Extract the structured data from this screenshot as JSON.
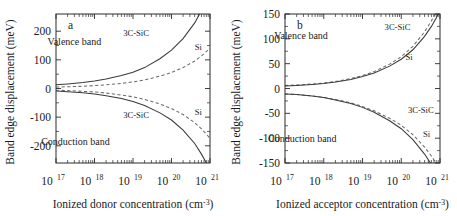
{
  "figure": {
    "panels": [
      "a",
      "b"
    ],
    "line_colors": {
      "solid": "#3a3a3a",
      "dashed": "#6b6b6b",
      "axis": "#2a2a2a"
    }
  },
  "chart_data": [
    {
      "type": "line",
      "panel": "a",
      "panel_letter": "a",
      "title": "",
      "xlabel": "Ionized donor concentration (cm",
      "xlabel_exponent": "-3",
      "xlabel_tail": ")",
      "ylabel": "Band edge displacement (meV)",
      "xscale": "log",
      "xlim": [
        1e+17,
        1e+21
      ],
      "ylim": [
        -260,
        260
      ],
      "xticks": [
        1e+17,
        1e+18,
        1e+19,
        1e+20,
        1e+21
      ],
      "xticklabels": [
        "10",
        "10",
        "10",
        "10",
        "10"
      ],
      "xtick_exponents": [
        "17",
        "18",
        "19",
        "20",
        "21"
      ],
      "yticks": [
        200,
        100,
        0,
        -100,
        -200
      ],
      "yticklabels": [
        "200",
        "100",
        "0",
        "-100",
        "-200"
      ],
      "grid": false,
      "legend": "inline-annotations",
      "annotations": [
        {
          "text": "Valence band",
          "x": 3e+17,
          "y": 152
        },
        {
          "text": "Conduction band",
          "x": 3.2e+17,
          "y": -196
        },
        {
          "text": "3C-SiC",
          "x": 1.2e+19,
          "y": 183
        },
        {
          "text": "Si",
          "x": 5e+20,
          "y": 133
        },
        {
          "text": "3C-SiC",
          "x": 1.2e+19,
          "y": -104
        },
        {
          "text": "Si",
          "x": 5e+20,
          "y": -92
        }
      ],
      "series": [
        {
          "name": "3C-SiC valence band",
          "material": "3C-SiC",
          "band": "valence",
          "style": "solid",
          "x": [
            1e+17,
            2e+17,
            5e+17,
            1e+18,
            2e+18,
            5e+18,
            1e+19,
            2e+19,
            5e+19,
            1e+20,
            2e+20,
            4e+20,
            6e+20,
            8e+20,
            1e+21
          ],
          "y": [
            13,
            16,
            21,
            26,
            33,
            45,
            57,
            73,
            104,
            134,
            174,
            229,
            272,
            308,
            338
          ]
        },
        {
          "name": "Si valence band",
          "material": "Si",
          "band": "valence",
          "style": "dashed",
          "x": [
            1e+17,
            2e+17,
            5e+17,
            1e+18,
            2e+18,
            5e+18,
            1e+19,
            2e+19,
            5e+19,
            1e+20,
            2e+20,
            4e+20,
            6e+20,
            8e+20,
            1e+21
          ],
          "y": [
            5,
            6,
            8,
            10,
            13,
            18,
            23,
            30,
            43,
            56,
            73,
            96,
            114,
            129,
            141
          ]
        },
        {
          "name": "3C-SiC conduction band",
          "material": "3C-SiC",
          "band": "conduction",
          "style": "solid",
          "x": [
            1e+17,
            2e+17,
            5e+17,
            1e+18,
            2e+18,
            5e+18,
            1e+19,
            2e+19,
            5e+19,
            1e+20,
            2e+20,
            4e+20,
            6e+20,
            8e+20,
            1e+21
          ],
          "y": [
            -9,
            -11,
            -15,
            -19,
            -25,
            -35,
            -45,
            -59,
            -85,
            -110,
            -145,
            -192,
            -229,
            -259,
            -285
          ]
        },
        {
          "name": "Si conduction band",
          "material": "Si",
          "band": "conduction",
          "style": "dashed",
          "x": [
            1e+17,
            2e+17,
            5e+17,
            1e+18,
            2e+18,
            5e+18,
            1e+19,
            2e+19,
            5e+19,
            1e+20,
            2e+20,
            4e+20,
            6e+20,
            8e+20,
            1e+21
          ],
          "y": [
            -6,
            -7,
            -10,
            -12,
            -16,
            -23,
            -29,
            -38,
            -54,
            -70,
            -91,
            -119,
            -141,
            -159,
            -174
          ]
        }
      ]
    },
    {
      "type": "line",
      "panel": "b",
      "panel_letter": "b",
      "title": "",
      "xlabel": "Ionized acceptor concentration (cm",
      "xlabel_exponent": "-3",
      "xlabel_tail": ")",
      "ylabel": "Band edge displacement (meV)",
      "xscale": "log",
      "xlim": [
        1e+17,
        1e+21
      ],
      "ylim": [
        -150,
        150
      ],
      "xticks": [
        1e+17,
        1e+18,
        1e+19,
        1e+20,
        1e+21
      ],
      "xticklabels": [
        "10",
        "10",
        "10",
        "10",
        "10"
      ],
      "xtick_exponents": [
        "17",
        "18",
        "19",
        "20",
        "21"
      ],
      "yticks": [
        150,
        100,
        50,
        0,
        -50,
        -100,
        -150
      ],
      "yticklabels": [
        "150",
        "100",
        "50",
        "0",
        "-50",
        "-100",
        "-150"
      ],
      "grid": false,
      "legend": "inline-annotations",
      "annotations": [
        {
          "text": "Valence band",
          "x": 2.6e+17,
          "y": 100
        },
        {
          "text": "Conduction band",
          "x": 2.8e+17,
          "y": -108
        },
        {
          "text": "3C-SiC",
          "x": 8e+19,
          "y": 118
        },
        {
          "text": "Si",
          "x": 1.6e+20,
          "y": 57
        },
        {
          "text": "3C-SiC",
          "x": 3.2e+20,
          "y": -50
        },
        {
          "text": "Si",
          "x": 4.5e+20,
          "y": -98
        }
      ],
      "series": [
        {
          "name": "3C-SiC valence band",
          "material": "3C-SiC",
          "band": "valence",
          "style": "dashed",
          "x": [
            1e+17,
            2e+17,
            5e+17,
            1e+18,
            2e+18,
            5e+18,
            1e+19,
            2e+19,
            5e+19,
            1e+20,
            2e+20,
            4e+20,
            6e+20,
            8e+20,
            1e+21
          ],
          "y": [
            6,
            7,
            9,
            11,
            14,
            20,
            26,
            34,
            49,
            64,
            85,
            114,
            136,
            155,
            171
          ]
        },
        {
          "name": "Si valence band",
          "material": "Si",
          "band": "valence",
          "style": "solid",
          "x": [
            1e+17,
            2e+17,
            5e+17,
            1e+18,
            2e+18,
            5e+18,
            1e+19,
            2e+19,
            5e+19,
            1e+20,
            2e+20,
            4e+20,
            6e+20,
            8e+20,
            1e+21
          ],
          "y": [
            5,
            6,
            8,
            10,
            13,
            18,
            24,
            31,
            45,
            59,
            78,
            105,
            125,
            142,
            157
          ]
        },
        {
          "name": "3C-SiC conduction band",
          "material": "3C-SiC",
          "band": "conduction",
          "style": "dashed",
          "x": [
            1e+17,
            2e+17,
            5e+17,
            1e+18,
            2e+18,
            5e+18,
            1e+19,
            2e+19,
            5e+19,
            1e+20,
            2e+20,
            4e+20,
            6e+20,
            8e+20,
            1e+21
          ],
          "y": [
            -11,
            -12,
            -15,
            -18,
            -22,
            -29,
            -36,
            -45,
            -60,
            -74,
            -93,
            -118,
            -136,
            -151,
            -164
          ]
        },
        {
          "name": "Si conduction band",
          "material": "Si",
          "band": "conduction",
          "style": "solid",
          "x": [
            1e+17,
            2e+17,
            5e+17,
            1e+18,
            2e+18,
            5e+18,
            1e+19,
            2e+19,
            5e+19,
            1e+20,
            2e+20,
            4e+20,
            6e+20,
            8e+20,
            1e+21
          ],
          "y": [
            -11,
            -12,
            -15,
            -18,
            -23,
            -30,
            -38,
            -48,
            -65,
            -81,
            -103,
            -132,
            -153,
            -170,
            -185
          ]
        }
      ]
    }
  ]
}
